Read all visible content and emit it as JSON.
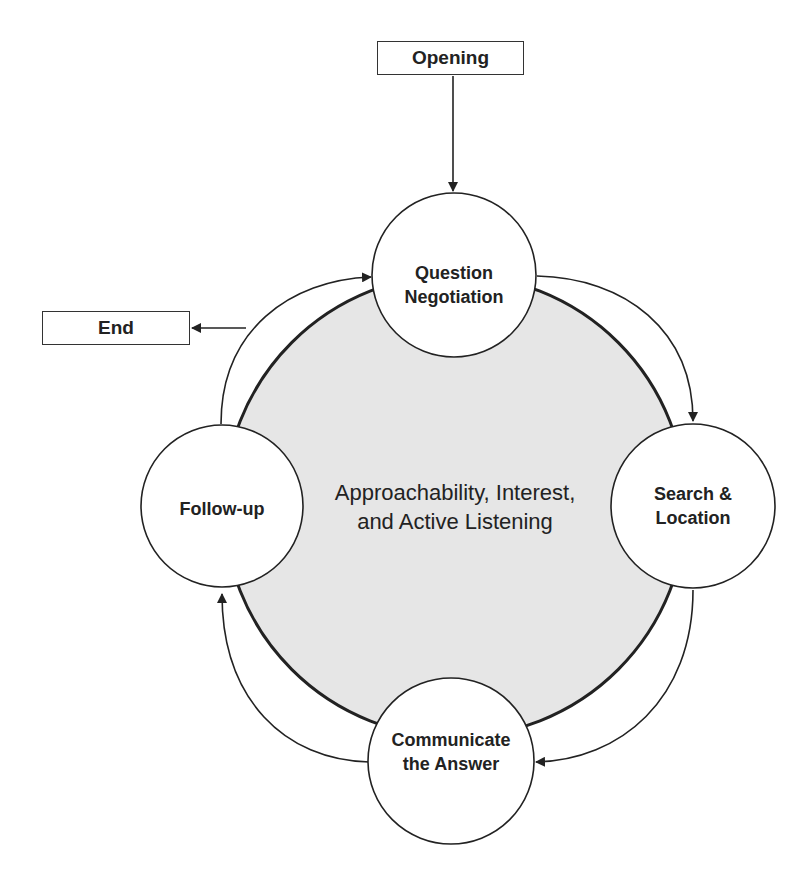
{
  "diagram": {
    "colors": {
      "stroke": "#333333",
      "core_fill": "#e6e6e6",
      "node_fill": "#ffffff"
    },
    "core": {
      "line1": "Approachability, Interest,",
      "line2": "and Active Listening"
    },
    "start_box": {
      "label": "Opening"
    },
    "end_box": {
      "label": "End"
    },
    "nodes": [
      {
        "id": "question",
        "line1": "Question",
        "line2": "Negotiation"
      },
      {
        "id": "search",
        "line1": "Search &",
        "line2": "Location"
      },
      {
        "id": "communicate",
        "line1": "Communicate",
        "line2": "the Answer"
      },
      {
        "id": "followup",
        "line1": "Follow-up",
        "line2": ""
      }
    ],
    "edges": [
      {
        "from": "Opening",
        "to": "Question Negotiation"
      },
      {
        "from": "Question Negotiation",
        "to": "Search & Location"
      },
      {
        "from": "Search & Location",
        "to": "Communicate the Answer"
      },
      {
        "from": "Communicate the Answer",
        "to": "Follow-up"
      },
      {
        "from": "Follow-up",
        "to": "Question Negotiation"
      },
      {
        "from": "Follow-up",
        "to": "End"
      }
    ]
  }
}
